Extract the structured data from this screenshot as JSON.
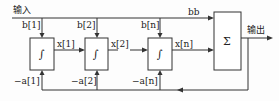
{
  "diagram": {
    "type": "block-diagram",
    "input_label": "输入",
    "output_label": "输出",
    "bb_label": "bb",
    "sum_block": {
      "symbol": "Σ"
    },
    "integrators": [
      {
        "symbol": "∫",
        "b_label": "b[1]",
        "x_label": "x[1]",
        "a_label": "−a[1]"
      },
      {
        "symbol": "∫",
        "b_label": "b[2]",
        "x_label": "x[2]",
        "a_label": "−a[2]"
      },
      {
        "symbol": "∫",
        "b_label": "b[n]",
        "x_label": "x[n]",
        "a_label": "−a[n]"
      }
    ],
    "colors": {
      "stroke": "#333333",
      "background": "#fdfdfd"
    }
  }
}
